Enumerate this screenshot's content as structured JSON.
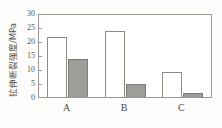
{
  "chart_data": {
    "type": "bar",
    "title": "",
    "xlabel": "",
    "ylabel": "拉伸断裂强度/MPa",
    "categories": [
      "A",
      "B",
      "C"
    ],
    "ylim": [
      0,
      30
    ],
    "yticks": [
      0,
      5,
      10,
      15,
      20,
      25,
      30
    ],
    "ytick_labels": [
      "0",
      "5",
      "10",
      "15",
      "20",
      "25",
      "30"
    ],
    "grid": false,
    "legend": "none",
    "series": [
      {
        "name": "series-1",
        "style": "open",
        "color": "#ffffff",
        "edge_color": "#8d8a83",
        "values": [
          22.0,
          24.3,
          9.2
        ]
      },
      {
        "name": "series-2",
        "style": "filled",
        "color": "#9d9d99",
        "edge_color": "#7d7b76",
        "values": [
          14.0,
          4.8,
          1.3
        ]
      }
    ]
  },
  "axis": {
    "y_title": "拉伸断裂强度/MPa",
    "tick_0": "0",
    "tick_5": "5",
    "tick_10": "10",
    "tick_15": "15",
    "tick_20": "20",
    "tick_25": "25",
    "tick_30": "30"
  },
  "categories": {
    "a": "A",
    "b": "B",
    "c": "C"
  }
}
